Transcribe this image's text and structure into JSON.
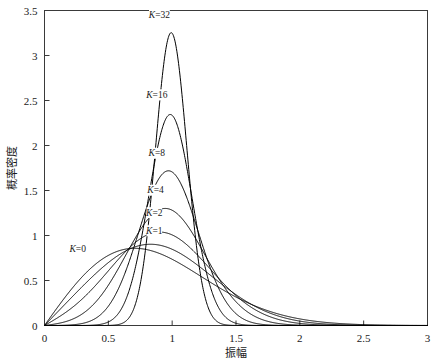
{
  "chart_data": {
    "type": "line",
    "title": "",
    "xlabel": "振幅",
    "ylabel": "概率密度",
    "xlim": [
      0,
      3
    ],
    "ylim": [
      0,
      3.5
    ],
    "grid": false,
    "legend_position": "inline-annotations",
    "xticks": [
      "0",
      "0.5",
      "1",
      "1.5",
      "2",
      "2.5",
      "3"
    ],
    "xtick_values": [
      0,
      0.5,
      1,
      1.5,
      2,
      2.5,
      3
    ],
    "yticks": [
      "0",
      "0.5",
      "1",
      "1.5",
      "2",
      "2.5",
      "3",
      "3.5"
    ],
    "ytick_values": [
      0,
      0.5,
      1,
      1.5,
      2,
      2.5,
      3,
      3.5
    ],
    "series": [
      {
        "name": "K=0",
        "label": "K=0",
        "k": 0,
        "peak_x": 0.62,
        "peak_y": 0.87,
        "label_x": 0.26,
        "label_y": 0.82
      },
      {
        "name": "K=1",
        "label": "K=1",
        "k": 1,
        "peak_x": 0.83,
        "peak_y": 0.95,
        "label_x": 0.86,
        "label_y": 1.02
      },
      {
        "name": "K=2",
        "label": "K=2",
        "k": 2,
        "peak_x": 0.86,
        "peak_y": 1.1,
        "label_x": 0.86,
        "label_y": 1.22
      },
      {
        "name": "K=4",
        "label": "K=4",
        "k": 4,
        "peak_x": 0.92,
        "peak_y": 1.29,
        "label_x": 0.87,
        "label_y": 1.47
      },
      {
        "name": "K=8",
        "label": "K=8",
        "k": 8,
        "peak_x": 0.95,
        "peak_y": 1.71,
        "label_x": 0.88,
        "label_y": 1.88
      },
      {
        "name": "K=16",
        "label": "K=16",
        "k": 16,
        "peak_x": 0.98,
        "peak_y": 2.34,
        "label_x": 0.88,
        "label_y": 2.53
      },
      {
        "name": "K=32",
        "label": "K=32",
        "k": 32,
        "peak_x": 1.0,
        "peak_y": 3.24,
        "label_x": 0.9,
        "label_y": 3.42
      }
    ],
    "colors": {
      "curve": "#000000",
      "axis": "#3a3a3a",
      "background": "#ffffff",
      "text": "#1a1a1a"
    }
  }
}
